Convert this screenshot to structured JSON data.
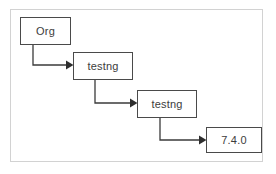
{
  "diagram": {
    "type": "flowchart",
    "orientation": "cascading-down-right",
    "frame": {
      "border_color": "#d2d2d2",
      "background_color": "#ffffff"
    },
    "style": {
      "node_border_color": "#4a4a4a",
      "node_fill_color": "#ffffff",
      "node_text_color": "#3c3c3c",
      "edge_color": "#3b3b3b",
      "arrowhead_color": "#2e2e2e"
    },
    "nodes": [
      {
        "id": "org",
        "label": "Org"
      },
      {
        "id": "testng-1",
        "label": "testng"
      },
      {
        "id": "testng-2",
        "label": "testng"
      },
      {
        "id": "version",
        "label": "7.4.0"
      }
    ],
    "edges": [
      {
        "from": "org",
        "to": "testng-1",
        "style": "elbow",
        "arrowhead": "solid-triangle"
      },
      {
        "from": "testng-1",
        "to": "testng-2",
        "style": "elbow",
        "arrowhead": "solid-triangle"
      },
      {
        "from": "testng-2",
        "to": "version",
        "style": "elbow",
        "arrowhead": "solid-triangle"
      }
    ]
  }
}
